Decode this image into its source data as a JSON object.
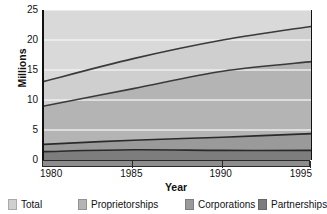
{
  "chart_data": {
    "type": "area",
    "title": "",
    "subtitle": "",
    "xlabel": "Year",
    "ylabel": "Millions",
    "x": [
      1980,
      1985,
      1990,
      1995
    ],
    "xtick_labels": [
      "1980",
      "1985",
      "1990",
      "1995"
    ],
    "ytick_labels": [
      "0",
      "5",
      "10",
      "15",
      "20",
      "25"
    ],
    "ytick_values": [
      0,
      5,
      10,
      15,
      20,
      25
    ],
    "xlim": [
      1980,
      1995
    ],
    "ylim": [
      0,
      25
    ],
    "grid": true,
    "grid_axis": "y",
    "legend_position": "bottom",
    "stacked": false,
    "series": [
      {
        "name": "Total",
        "color": "#cfcfcf",
        "line_color": "#3a3a3a",
        "values": [
          13.1,
          16.9,
          20.0,
          22.3
        ]
      },
      {
        "name": "Proprietorships",
        "color": "#b4b4b4",
        "line_color": "#3a3a3a",
        "values": [
          9.0,
          11.9,
          14.8,
          16.4
        ]
      },
      {
        "name": "Corporations",
        "color": "#9a9a9a",
        "line_color": "#2a2a2a",
        "values": [
          2.6,
          3.3,
          3.8,
          4.4
        ]
      },
      {
        "name": "Partnerships",
        "color": "#7d7d7d",
        "line_color": "#2a2a2a",
        "values": [
          1.4,
          1.7,
          1.6,
          1.6
        ]
      }
    ]
  },
  "axes": {
    "y_title": "Millions",
    "x_title": "Year",
    "y_ticks": [
      {
        "label": "25",
        "value": 25
      },
      {
        "label": "20",
        "value": 20
      },
      {
        "label": "15",
        "value": 15
      },
      {
        "label": "10",
        "value": 10
      },
      {
        "label": "5",
        "value": 5
      },
      {
        "label": "0",
        "value": 0
      }
    ],
    "x_ticks": [
      {
        "label": "1980",
        "value": 1980
      },
      {
        "label": "1985",
        "value": 1985
      },
      {
        "label": "1990",
        "value": 1990
      },
      {
        "label": "1995",
        "value": 1995
      }
    ]
  },
  "legend": {
    "items": [
      {
        "label": "Total",
        "color": "#cfcfcf"
      },
      {
        "label": "Proprietorships",
        "color": "#b4b4b4"
      },
      {
        "label": "Corporations",
        "color": "#9a9a9a"
      },
      {
        "label": "Partnerships",
        "color": "#7d7d7d"
      }
    ]
  },
  "colors": {
    "plot_background_top": "#d9d9d9",
    "axis": "#111111",
    "gridline": "#f2f2f2",
    "text": "#111111",
    "xaxis_bar": "#8d8d8d"
  }
}
